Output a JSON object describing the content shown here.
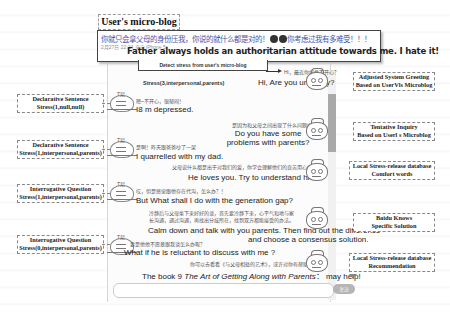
{
  "title": "User's micro-blog",
  "microblog": {
    "text_cn": "你就只会拿父母的身份压我，你说的就什么都是对的！",
    "text_cn_tail": "你考虑过我有多难受！！！",
    "meta": "2月27日 22:24 来自 iPhone 5s",
    "text_en": "Father always holds an authoritarian attitude towards me. I hate it!"
  },
  "detect_label": "Detect stress from user's micro-blog",
  "stress_top": "Stress(3,interpersonal,parents)",
  "messages": [
    {
      "role": "system",
      "cn": "Hi，最近你好像不开心？",
      "en": "Hi, Are you unhappy?"
    },
    {
      "role": "user",
      "cn": "嗯~不开心，很郁闷！",
      "en": "I8  m depressed."
    },
    {
      "role": "system",
      "cn": "是因为和父母之间出现了什么问题吗？",
      "en": "Do you have some problems with parents?"
    },
    {
      "role": "user",
      "cn": "是啊！昨天跟爸爸吵了一架",
      "en": "I quarrelled with my dad."
    },
    {
      "role": "system",
      "cn": "父母说什么都是出于对我们的爱，你学会理解他们的良苦用心吧。",
      "en": "He loves you. Try to understand him."
    },
    {
      "role": "user",
      "cn": "哎，但是感觉跟他存在代沟，怎么办？！",
      "en": "But What shall I do with the generation gap?"
    },
    {
      "role": "system",
      "cn": "冷静后与父母坐下来好好的谈，首先要冷静下来，心平气和地与家长沟通，通过沟通，再找出分歧所在，找到双方都能接受的办法。",
      "en1": "Calm down and talk with you parents. Then find out the difference",
      "en2": "and choose a consensus solution."
    },
    {
      "role": "user",
      "cn": "要是他他不愿意跟我谈怎么办呢？",
      "en": "What if he is reluctant to discuss with me ?"
    },
    {
      "role": "system",
      "cn": "你可以去看看《与父母相处的艺术》，或许对你有帮助。",
      "en_pre": "The book 9  ",
      "en_title": "The Art of Getting Along with Parents",
      "en_post": "：  may help!"
    }
  ],
  "left_notes": [
    {
      "line1": "Declarative Sentence",
      "line2": "Stress(1,null,null)"
    },
    {
      "line1": "Declarative Sentence",
      "line2": "Stress(1,interpersonal,parents)"
    },
    {
      "line1": "Interrogative Question",
      "line2": "Stress(1,interpersonal,parents)"
    },
    {
      "line1": "Interrogative Question",
      "line2": "Stress(0,interpersonal,parents)"
    }
  ],
  "right_notes": [
    {
      "line1": "Adjusted System Greeting",
      "line2": "Based on UserVls Microblog"
    },
    {
      "line1": "Tentative Inquiry",
      "line2": "Based on Userl  s Microblog"
    },
    {
      "line1": "Local Stress-release database",
      "line2": "Comfort words"
    },
    {
      "line1": "Baidu Knows",
      "line2": "Specific Solution"
    },
    {
      "line1": "Local Stress-release database",
      "line2": "Recommendation"
    }
  ],
  "input": {
    "placeholder": "",
    "send_label": "发送"
  }
}
